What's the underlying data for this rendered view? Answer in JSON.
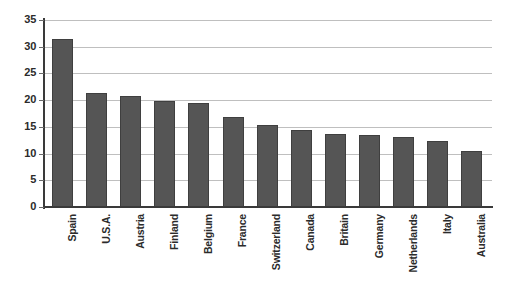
{
  "chart_data": {
    "type": "bar",
    "title": "",
    "subtitle": "",
    "xlabel": "",
    "ylabel": "",
    "ylim": [
      0,
      35
    ],
    "yticks": [
      0,
      5,
      10,
      15,
      20,
      25,
      30,
      35
    ],
    "ytick_labels": [
      "0",
      "5",
      "10",
      "15",
      "20",
      "25",
      "30",
      "35"
    ],
    "grid": true,
    "legend": false,
    "legend_position": "none",
    "orientation": "vertical",
    "bar_color": "#555555",
    "bar_edge_color": "#3f3f3f",
    "gridline_color": "#bfbfbf",
    "axis_color": "#3a3a3a",
    "categories": [
      "Spain",
      "U.S.A.",
      "Austria",
      "Finland",
      "Belgium",
      "France",
      "Switzerland",
      "Canada",
      "Britain",
      "Germany",
      "Netherlands",
      "Italy",
      "Australia"
    ],
    "values": [
      31.4,
      21.4,
      20.7,
      19.8,
      19.4,
      16.8,
      15.4,
      14.5,
      13.6,
      13.5,
      13.1,
      12.3,
      10.5
    ]
  }
}
